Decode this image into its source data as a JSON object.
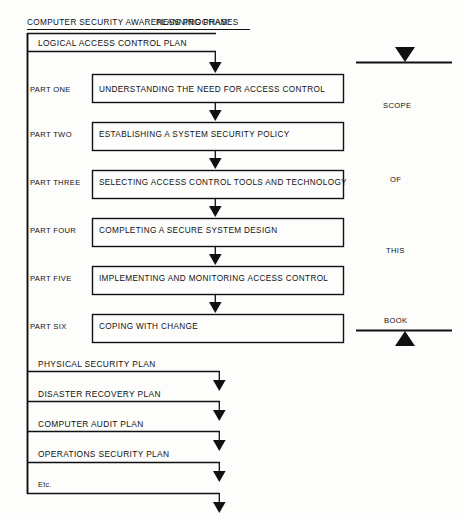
{
  "document": {
    "title_main": "COMPUTER SECURITY AWARENESS PROGRAM:",
    "title_sub": "PLANNING PHASES",
    "type": "flowchart"
  },
  "top_plan": {
    "label": "LOGICAL ACCESS CONTROL PLAN"
  },
  "parts": [
    {
      "part": "PART ONE",
      "title": "UNDERSTANDING THE NEED FOR ACCESS CONTROL"
    },
    {
      "part": "PART TWO",
      "title": "ESTABLISHING A SYSTEM SECURITY POLICY"
    },
    {
      "part": "PART THREE",
      "title": "SELECTING ACCESS CONTROL TOOLS AND TECHNOLOGY"
    },
    {
      "part": "PART FOUR",
      "title": "COMPLETING A SECURE SYSTEM DESIGN"
    },
    {
      "part": "PART FIVE",
      "title": "IMPLEMENTING AND MONITORING ACCESS CONTROL"
    },
    {
      "part": "PART SIX",
      "title": "COPING WITH CHANGE"
    }
  ],
  "scope_bracket": {
    "words": [
      "SCOPE",
      "OF",
      "THIS",
      "BOOK"
    ]
  },
  "other_plans": [
    {
      "label": "PHYSICAL SECURITY PLAN"
    },
    {
      "label": "DISASTER RECOVERY PLAN"
    },
    {
      "label": "COMPUTER AUDIT PLAN"
    },
    {
      "label": "OPERATIONS SECURITY PLAN"
    },
    {
      "label": "Etc."
    }
  ],
  "colors": {
    "ink": "#111111",
    "paper": "#fdfdfc"
  }
}
